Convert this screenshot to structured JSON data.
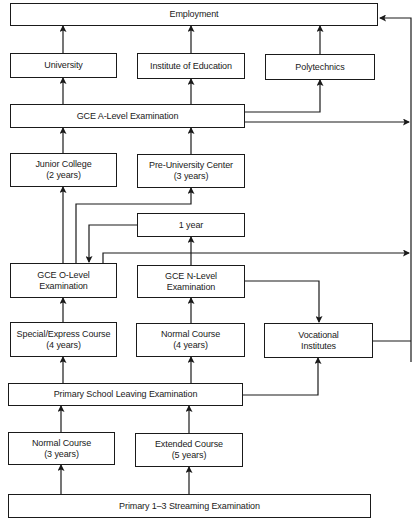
{
  "diagram": {
    "boxes": {
      "employment": {
        "label": "Employment"
      },
      "university": {
        "label": "University"
      },
      "institute": {
        "label": "Institute of Education"
      },
      "polytechnics": {
        "label": "Polytechnics"
      },
      "a_level": {
        "label": "GCE A-Level Examination"
      },
      "junior_college": {
        "label": "Junior College",
        "sub": "(2 years)"
      },
      "pre_university": {
        "label": "Pre-University Center",
        "sub": "(3 years)"
      },
      "one_year": {
        "label": "1 year"
      },
      "o_level": {
        "label": "GCE O-Level",
        "sub": "Examination"
      },
      "n_level": {
        "label": "GCE N-Level",
        "sub": "Examination"
      },
      "special_express": {
        "label": "Special/Express Course",
        "sub": "(4 years)"
      },
      "normal_secondary": {
        "label": "Normal Course",
        "sub": "(4 years)"
      },
      "vocational": {
        "label": "Vocational",
        "sub": "Institutes"
      },
      "psle": {
        "label": "Primary School Leaving Examination"
      },
      "normal_primary": {
        "label": "Normal Course",
        "sub": "(3 years)"
      },
      "extended_primary": {
        "label": "Extended Course",
        "sub": "(5 years)"
      },
      "streaming": {
        "label": "Primary 1–3 Streaming Examination"
      }
    },
    "line_color": "#1a1a1a"
  }
}
